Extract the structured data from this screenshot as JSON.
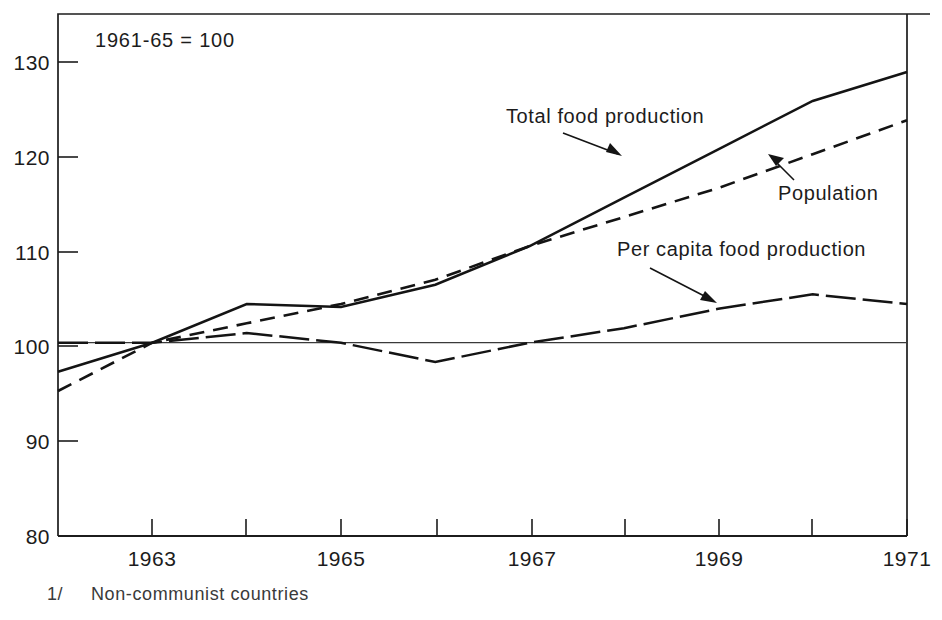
{
  "figure": {
    "base_note": "1961-65 = 100",
    "footnote_marker": "1/",
    "footnote_text": "Non-communist countries",
    "title_fragment": ""
  },
  "axes": {
    "y_ticks": [
      "130",
      "120",
      "110",
      "100",
      "90",
      "80"
    ],
    "y_values": [
      130,
      120,
      110,
      100,
      90,
      80
    ],
    "x_ticks": [
      "1963",
      "1965",
      "1967",
      "1969",
      "1971"
    ],
    "x_tick_values": [
      1963,
      1965,
      1967,
      1969,
      1971
    ],
    "x_minor_values": [
      1964,
      1966,
      1968,
      1970
    ],
    "x_min": 1962,
    "x_max": 1971,
    "y_min": 80,
    "y_max": 134,
    "reference_value": 100
  },
  "annotations": [
    {
      "label": "Total food production",
      "series": "total_food_production"
    },
    {
      "label": "Population",
      "series": "population"
    },
    {
      "label": "Per capita food production",
      "series": "per_capita_food_production"
    }
  ],
  "colors": {
    "ink": "#141414",
    "axis": "#1c1c1c",
    "background": "#ffffff",
    "reference": "#3a3a3a"
  },
  "chart_data": {
    "type": "line",
    "subtitle": "1961-65 = 100",
    "xlabel": "",
    "ylabel": "",
    "xlim": [
      1962,
      1971
    ],
    "ylim": [
      80,
      134
    ],
    "grid": false,
    "legend": "inline-annotations",
    "note": "1/ Non-communist countries",
    "x": [
      1962,
      1963,
      1964,
      1965,
      1966,
      1967,
      1968,
      1969,
      1970,
      1971
    ],
    "series": [
      {
        "name": "Total food production",
        "style": "solid",
        "values": [
          97,
          100,
          104,
          103.7,
          106,
          110,
          115,
          120,
          125,
          128
        ]
      },
      {
        "name": "Population",
        "style": "dashed",
        "values": [
          95,
          100,
          102,
          104,
          106.5,
          110,
          113,
          116,
          119.5,
          123
        ]
      },
      {
        "name": "Per capita food production",
        "style": "dash-dot",
        "values": [
          100,
          100,
          101,
          100,
          98,
          100,
          101.5,
          103.5,
          105,
          104
        ]
      }
    ]
  }
}
